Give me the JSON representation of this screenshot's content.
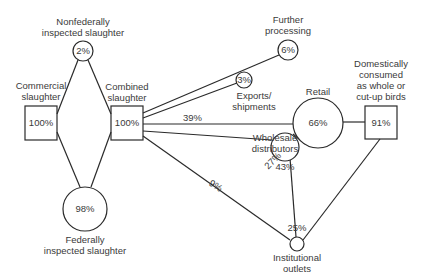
{
  "diagram": {
    "type": "flow",
    "nodes": [
      {
        "id": "commercial",
        "label": [
          "Commercial",
          "slaughter"
        ],
        "value": "100%",
        "shape": "box"
      },
      {
        "id": "nonfederal",
        "label": [
          "Nonfederally",
          "inspected slaughter"
        ],
        "value": "2%",
        "shape": "circle"
      },
      {
        "id": "federal",
        "label": [
          "Federally",
          "inspected slaughter"
        ],
        "value": "98%",
        "shape": "circle"
      },
      {
        "id": "combined",
        "label": [
          "Combined",
          "slaughter"
        ],
        "value": "100%",
        "shape": "box"
      },
      {
        "id": "further",
        "label": [
          "Further",
          "processing"
        ],
        "value": "6%",
        "shape": "circle"
      },
      {
        "id": "exports",
        "label": [
          "Exports/",
          "shipments"
        ],
        "value": "3%",
        "shape": "circle"
      },
      {
        "id": "retail",
        "label": [
          "Retail"
        ],
        "value": "66%",
        "shape": "circle"
      },
      {
        "id": "wholesale",
        "label": [
          "Wholesale",
          "distributors"
        ],
        "value": "43%",
        "shape": "circle"
      },
      {
        "id": "institutional",
        "label": [
          "Institutional",
          "outlets"
        ],
        "value": "25%",
        "shape": "circle"
      },
      {
        "id": "domestic",
        "label": [
          "Domestically",
          "consumed",
          "as whole or",
          "cut-up birds"
        ],
        "value": "91%",
        "shape": "box"
      }
    ],
    "edges": [
      {
        "from": "commercial",
        "to": "nonfederal",
        "label": ""
      },
      {
        "from": "commercial",
        "to": "federal",
        "label": ""
      },
      {
        "from": "nonfederal",
        "to": "combined",
        "label": ""
      },
      {
        "from": "federal",
        "to": "combined",
        "label": ""
      },
      {
        "from": "combined",
        "to": "further",
        "label": ""
      },
      {
        "from": "combined",
        "to": "exports",
        "label": ""
      },
      {
        "from": "combined",
        "to": "retail",
        "label": "39%"
      },
      {
        "from": "combined",
        "to": "wholesale",
        "label": ""
      },
      {
        "from": "combined",
        "to": "institutional",
        "label": "9%"
      },
      {
        "from": "wholesale",
        "to": "retail",
        "label": "27%"
      },
      {
        "from": "wholesale",
        "to": "institutional",
        "label": ""
      },
      {
        "from": "retail",
        "to": "domestic",
        "label": ""
      },
      {
        "from": "institutional",
        "to": "domestic",
        "label": ""
      }
    ]
  },
  "colors": {
    "line": "#2a2a2a",
    "text": "#3a3a3a",
    "background": "#ffffff"
  }
}
